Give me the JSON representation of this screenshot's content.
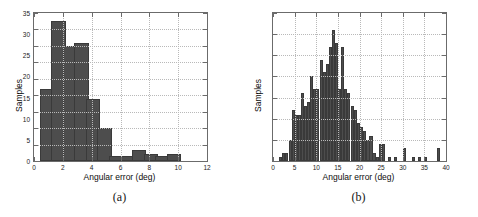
{
  "figure": {
    "panels": [
      {
        "caption": "(a)",
        "y_axis_title": "Samples",
        "x_axis_title": "Angular error (deg)"
      },
      {
        "caption": "(b)",
        "y_axis_title": "Samples",
        "x_axis_title": "Angular error (deg)"
      }
    ]
  },
  "chart_data": [
    {
      "type": "bar",
      "title": "",
      "subtitle": "",
      "panel_label": "(a)",
      "xlabel": "Angular error (deg)",
      "ylabel": "Samples",
      "xlim": [
        0,
        12
      ],
      "ylim": [
        0,
        90
      ],
      "xticks": [
        0,
        2,
        4,
        6,
        8,
        10,
        12
      ],
      "xtick_labels": [
        "0",
        "2",
        "4",
        "6",
        "8",
        "10",
        "12"
      ],
      "yticks": [
        0,
        10,
        20,
        30,
        40,
        50,
        60,
        70,
        80,
        90
      ],
      "ytick_labels": [
        "0",
        "10",
        "20",
        "30",
        "40",
        "50",
        "60",
        "70",
        "80",
        "90"
      ],
      "grid": true,
      "legend": null,
      "bin_width": 1,
      "bar_color": "#4d4d4d",
      "bin_starts": [
        0.4,
        1.2,
        2.0,
        2.8,
        3.6,
        4.4,
        5.2,
        6.0,
        6.8,
        7.6,
        8.4,
        9.2
      ],
      "categories": [
        "0.4-1.2",
        "1.2-2.0",
        "2.0-2.8",
        "2.8-3.6",
        "3.6-4.4",
        "4.4-5.2",
        "5.2-6.0",
        "6.0-6.8",
        "6.8-7.6",
        "7.6-8.4",
        "8.4-9.2",
        "9.2-10.0"
      ],
      "values": [
        44,
        85,
        70,
        72,
        38,
        20,
        3,
        3,
        7,
        4,
        3,
        4
      ]
    },
    {
      "type": "bar",
      "title": "",
      "subtitle": "",
      "panel_label": "(b)",
      "xlabel": "Angular error (deg)",
      "ylabel": "Samples",
      "xlim": [
        0,
        40
      ],
      "ylim": [
        0,
        35
      ],
      "xticks": [
        0,
        5,
        10,
        15,
        20,
        25,
        30,
        35,
        40
      ],
      "xtick_labels": [
        "0",
        "5",
        "10",
        "15",
        "20",
        "25",
        "30",
        "35",
        "40"
      ],
      "yticks": [
        0,
        5,
        10,
        15,
        20,
        25,
        30,
        35
      ],
      "ytick_labels": [
        "0",
        "5",
        "10",
        "15",
        "20",
        "25",
        "30",
        "35"
      ],
      "grid": true,
      "legend": null,
      "bin_width": 0.72,
      "bar_color": "#4d4d4d",
      "bin_starts": [
        1.4,
        2.1,
        2.8,
        3.6,
        4.3,
        5.0,
        5.7,
        6.4,
        7.2,
        7.9,
        8.6,
        9.3,
        10.0,
        10.8,
        11.5,
        12.2,
        12.9,
        13.6,
        14.4,
        15.1,
        15.8,
        16.5,
        17.2,
        18.0,
        18.7,
        19.4,
        20.1,
        20.8,
        21.6,
        22.3,
        23.0,
        23.7,
        24.4,
        25.2,
        26.6,
        28.0,
        30.1,
        32.2,
        33.6,
        35.0,
        38.0
      ],
      "categories": [
        "1.4",
        "2.1",
        "2.8",
        "3.6",
        "4.3",
        "5.0",
        "5.7",
        "6.4",
        "7.2",
        "7.9",
        "8.6",
        "9.3",
        "10.0",
        "10.8",
        "11.5",
        "12.2",
        "12.9",
        "13.6",
        "14.4",
        "15.1",
        "15.8",
        "16.5",
        "17.2",
        "18.0",
        "18.7",
        "19.4",
        "20.1",
        "20.8",
        "21.6",
        "22.3",
        "23.0",
        "23.7",
        "24.4",
        "25.2",
        "26.6",
        "28.0",
        "30.1",
        "32.2",
        "33.6",
        "35.0",
        "38.0"
      ],
      "values": [
        1,
        2,
        2,
        5,
        12,
        11,
        11,
        16,
        13,
        14,
        20,
        17,
        17,
        24,
        21,
        23,
        27,
        31,
        28,
        17,
        27,
        17,
        16,
        13,
        12,
        9,
        8,
        7,
        5,
        6,
        2,
        1,
        4,
        4,
        1,
        1,
        3,
        1,
        1,
        1,
        3
      ]
    }
  ]
}
